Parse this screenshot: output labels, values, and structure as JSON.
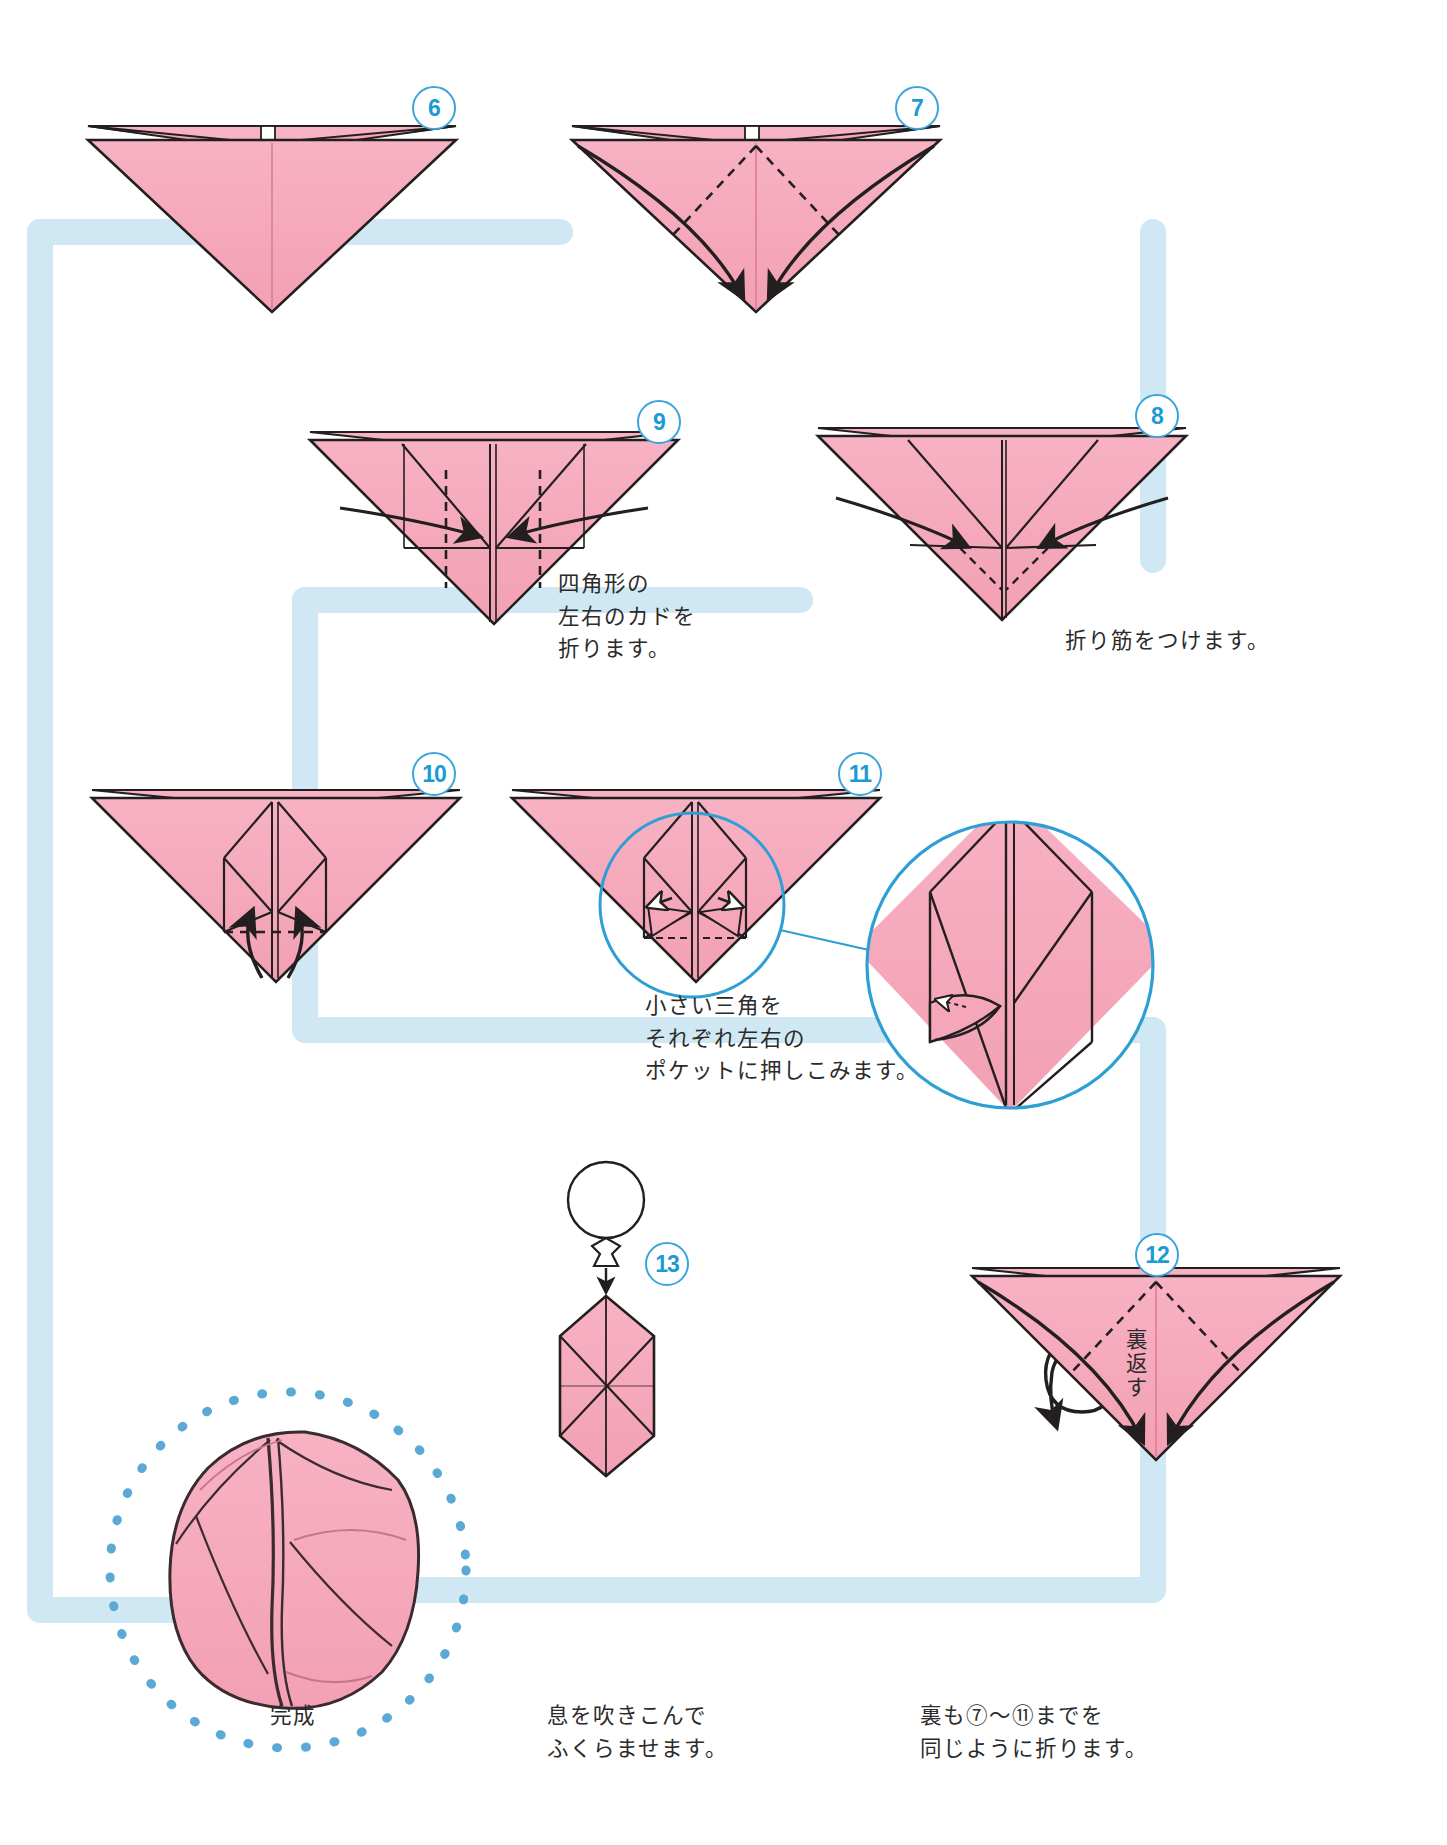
{
  "page": {
    "language": "ja",
    "background": "#ffffff",
    "paper_color": "#f5a6b9",
    "paper_shade": "#eb92a8",
    "paper_highlight": "#f8bccb",
    "line_color": "#231f20",
    "accent_blue": "#1b9ad6",
    "connector_blue": "#cfe8f4",
    "dotted_blue": "#5aa9d6"
  },
  "steps": [
    {
      "id": "step6",
      "number": "6",
      "badge_pos": {
        "x": 412,
        "y": 86
      },
      "caption": "",
      "kind": "triangle-plain"
    },
    {
      "id": "step7",
      "number": "7",
      "badge_pos": {
        "x": 895,
        "y": 86
      },
      "caption": "",
      "kind": "triangle-fold-down-arrows"
    },
    {
      "id": "step8",
      "number": "8",
      "badge_pos": {
        "x": 1135,
        "y": 394
      },
      "caption": "折り筋をつけます。",
      "caption_pos": {
        "x": 1065,
        "y": 625
      },
      "kind": "triangle-crease-side-arrows"
    },
    {
      "id": "step9",
      "number": "9",
      "badge_pos": {
        "x": 637,
        "y": 400
      },
      "caption": "四角形の\n左右のカドを\n折ります。",
      "caption_pos": {
        "x": 558,
        "y": 568
      },
      "kind": "triangle-corner-fold"
    },
    {
      "id": "step10",
      "number": "10",
      "badge_pos": {
        "x": 412,
        "y": 752
      },
      "caption": "",
      "kind": "triangle-up-arrows"
    },
    {
      "id": "step11",
      "number": "11",
      "badge_pos": {
        "x": 838,
        "y": 752
      },
      "caption": "小さい三角を\nそれぞれ左右の\nポケットに押しこみます。",
      "caption_pos": {
        "x": 645,
        "y": 990
      },
      "kind": "triangle-pocket-tuck"
    },
    {
      "id": "step12",
      "number": "12",
      "badge_pos": {
        "x": 1135,
        "y": 1233
      },
      "caption": "裏も⑦〜⑪までを\n同じように折ります。",
      "caption_pos": {
        "x": 920,
        "y": 1700
      },
      "kind": "triangle-fold-down-arrows"
    },
    {
      "id": "step13",
      "number": "13",
      "badge_pos": {
        "x": 645,
        "y": 1242
      },
      "caption": "息を吹きこんで\nふくらませます。",
      "caption_pos": {
        "x": 547,
        "y": 1700
      },
      "kind": "hexagon-blow"
    }
  ],
  "detail_callout": {
    "id": "detail-circle",
    "label": "",
    "source_circle": {
      "cx": 692,
      "cy": 905,
      "r": 92
    },
    "target_circle": {
      "cx": 1010,
      "cy": 965,
      "r": 143
    }
  },
  "turn_over": {
    "label": "裏返す",
    "pos": {
      "x": 1090,
      "y": 1340
    }
  },
  "finished": {
    "label": "完成",
    "pos": {
      "x": 290,
      "y": 1710
    },
    "circle": {
      "cx": 288,
      "cy": 1570,
      "r": 178
    }
  },
  "icons": {
    "balloon": "blow-balloon-icon",
    "turn_over_arrow": "turn-over-loop-arrow-icon",
    "fold_arrow": "fold-arrow-icon",
    "push_arrow": "push-in-arrow-icon"
  }
}
